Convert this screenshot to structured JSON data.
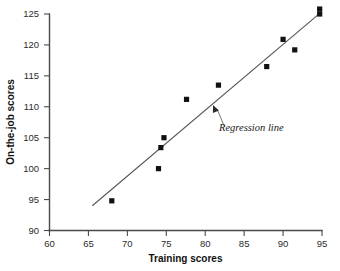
{
  "chart_data": {
    "type": "scatter",
    "title": "",
    "xlabel": "Training scores",
    "ylabel": "On-the-job scores",
    "xlim": [
      60,
      95
    ],
    "ylim": [
      90,
      125
    ],
    "xticks": [
      60,
      65,
      70,
      75,
      80,
      85,
      90,
      95
    ],
    "yticks": [
      90,
      95,
      100,
      105,
      110,
      115,
      120,
      125
    ],
    "grid": false,
    "legend": null,
    "marker_style": "filled-square",
    "series": [
      {
        "name": "Trainees",
        "points": [
          {
            "x": 68.0,
            "y": 94.8
          },
          {
            "x": 74.0,
            "y": 100.0
          },
          {
            "x": 74.3,
            "y": 103.4
          },
          {
            "x": 74.7,
            "y": 105.0
          },
          {
            "x": 77.6,
            "y": 111.2
          },
          {
            "x": 81.7,
            "y": 113.5
          },
          {
            "x": 87.9,
            "y": 116.5
          },
          {
            "x": 90.0,
            "y": 120.9
          },
          {
            "x": 91.5,
            "y": 119.2
          },
          {
            "x": 94.7,
            "y": 125.0
          },
          {
            "x": 94.7,
            "y": 125.8
          }
        ]
      }
    ],
    "regression_line": {
      "label": "Regression line",
      "x_start": 65.5,
      "y_start": 94.0,
      "x_end": 94.9,
      "y_end": 125.3
    },
    "annotations": [
      {
        "text": "Regression line",
        "x": 82.5,
        "y": 106.7,
        "points_to_x": 81.0,
        "points_to_y": 110.3
      }
    ],
    "colors": {
      "marker": "#111111",
      "axis": "#4a4a4a",
      "regression": "#555555",
      "text": "#1a1a1a",
      "background": "#ffffff"
    }
  }
}
